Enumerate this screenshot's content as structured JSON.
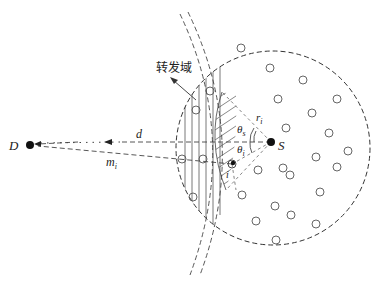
{
  "diagram": {
    "title": "",
    "labels": {
      "destination": "D",
      "source": "S",
      "distance": "d",
      "relay_distance": "m",
      "relay_distance_sub": "i",
      "relay_node": "i",
      "radius": "r",
      "radius_sub": "i",
      "angle_upper": "θ",
      "angle_upper_sub": "s",
      "angle_lower": "θ",
      "angle_lower_sub": "i",
      "forwarding_region": "转发域"
    },
    "colors": {
      "stroke": "#333333",
      "hatch": "#555555",
      "node_fill": "#111111",
      "background": "#ffffff"
    },
    "nodes": {
      "D": {
        "x": 30,
        "y": 145
      },
      "S": {
        "x": 271,
        "y": 142
      },
      "relay_i": {
        "x": 232,
        "y": 164
      }
    },
    "coverage_circle": {
      "cx": 273,
      "cy": 148,
      "r": 97
    },
    "neighbor_nodes": [
      [
        270,
        68
      ],
      [
        303,
        80
      ],
      [
        278,
        99
      ],
      [
        337,
        99
      ],
      [
        312,
        113
      ],
      [
        286,
        128
      ],
      [
        329,
        133
      ],
      [
        316,
        157
      ],
      [
        345,
        151
      ],
      [
        337,
        167
      ],
      [
        283,
        168
      ],
      [
        290,
        175
      ],
      [
        320,
        192
      ],
      [
        275,
        206
      ],
      [
        291,
        215
      ],
      [
        316,
        224
      ],
      [
        256,
        221
      ],
      [
        275,
        240
      ],
      [
        221,
        44
      ],
      [
        210,
        81
      ],
      [
        196,
        110
      ],
      [
        204,
        128
      ],
      [
        188,
        151
      ],
      [
        195,
        170
      ],
      [
        221,
        156
      ],
      [
        193,
        197
      ],
      [
        218,
        113
      ]
    ]
  }
}
